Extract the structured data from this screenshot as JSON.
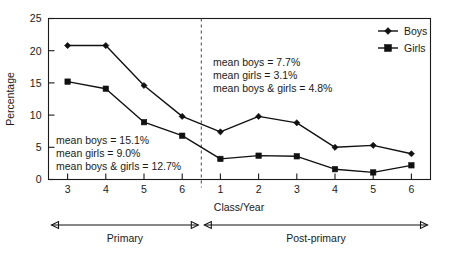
{
  "chart_data": {
    "type": "line",
    "title": "",
    "xlabel": "Class/Year",
    "ylabel": "Percentage",
    "ylim": [
      0,
      25
    ],
    "yticks": [
      0,
      5,
      10,
      15,
      20,
      25
    ],
    "ytick_labels": [
      "0",
      "5",
      "10",
      "15",
      "20",
      "25"
    ],
    "grid": false,
    "legend_position": "top-right",
    "categories": [
      "3",
      "4",
      "5",
      "6",
      "1",
      "2",
      "3",
      "4",
      "5",
      "6"
    ],
    "series": [
      {
        "name": "Boys",
        "marker": "diamond",
        "values": [
          20.8,
          20.8,
          14.6,
          9.8,
          7.4,
          9.8,
          8.8,
          5.0,
          5.3,
          4.0
        ]
      },
      {
        "name": "Girls",
        "marker": "square",
        "values": [
          15.2,
          14.1,
          8.9,
          6.8,
          3.2,
          3.7,
          3.6,
          1.6,
          1.1,
          2.2
        ]
      }
    ],
    "annotations": [
      {
        "id": "primary-means",
        "lines": [
          "mean boys = 15.1%",
          "mean girls = 9.0%",
          "mean boys & girls = 12.7%"
        ]
      },
      {
        "id": "post-primary-means",
        "lines": [
          "mean boys = 7.7%",
          "mean girls = 3.1%",
          "mean boys & girls = 4.8%"
        ]
      }
    ],
    "group_spans": [
      {
        "label": "Primary",
        "categories": [
          "3",
          "4",
          "5",
          "6"
        ]
      },
      {
        "label": "Post-primary",
        "categories": [
          "1",
          "2",
          "3",
          "4",
          "5",
          "6"
        ]
      }
    ],
    "divider": {
      "between": [
        "6",
        "1"
      ],
      "style": "dashed"
    },
    "colors": {
      "line": "#111111",
      "marker": "#111111",
      "axis": "#1a1a1a",
      "text": "#1a1a1a",
      "background": "#ffffff"
    }
  },
  "legend": {
    "items": [
      {
        "label": "Boys"
      },
      {
        "label": "Girls"
      }
    ]
  },
  "axis": {
    "y_title": "Percentage",
    "x_title": "Class/Year"
  }
}
